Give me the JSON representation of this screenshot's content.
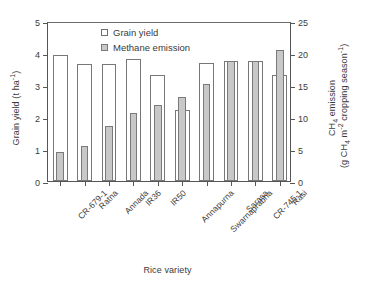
{
  "chart_data": {
    "type": "bar",
    "title": "",
    "xlabel": "Rice variety",
    "ylabel": "Grain yield (t ha-1)",
    "y2label": "CH4 emission (g CH4 m-2 cropping season-1)",
    "categories": [
      "CR-679-1",
      "Ratna",
      "Annada",
      "IR36",
      "IR50",
      "Annapurna",
      "Swarnaprabha",
      "Sarasa",
      "CR-745-1",
      "Rasi"
    ],
    "series": [
      {
        "name": "Grain yield",
        "axis": "left",
        "unit": "t ha-1",
        "values": [
          3.95,
          3.66,
          3.67,
          3.82,
          3.32,
          2.21,
          3.68,
          3.76,
          3.76,
          3.31
        ]
      },
      {
        "name": "Methane emission",
        "axis": "right",
        "unit": "g CH4 m-2 cropping season-1",
        "values": [
          4.5,
          5.5,
          8.6,
          10.7,
          11.9,
          13.1,
          15.2,
          18.8,
          18.8,
          20.4
        ]
      }
    ],
    "ylim": [
      0,
      5
    ],
    "y2lim": [
      0,
      25
    ],
    "yticks": [
      0,
      1,
      2,
      3,
      4,
      5
    ],
    "y2ticks": [
      0,
      5,
      10,
      15,
      20,
      25
    ],
    "grid": false,
    "legend_position": "top-center",
    "frame": true
  },
  "axes": {
    "left_title_main": "Grain yield (t ha",
    "left_title_sup": "-1",
    "left_title_tail": ")",
    "right_title_line1_main": "CH",
    "right_title_line1_sub": "4",
    "right_title_line1_tail": " emission",
    "right_title_line2_a": "(g CH",
    "right_title_line2_sub1": "4",
    "right_title_line2_b": " m",
    "right_title_line2_sup1": "-2",
    "right_title_line2_c": " cropping season",
    "right_title_line2_sup2": "-1",
    "right_title_line2_d": ")",
    "x_title": "Rice variety"
  },
  "legend": {
    "items": [
      {
        "label": "Grain yield",
        "color": "#ffffff",
        "border": "#6f6f6f"
      },
      {
        "label": "Methane emission",
        "color": "#c8c8c8",
        "border": "#7a7a7a"
      }
    ]
  },
  "colors": {
    "grain_yield_fill": "#ffffff",
    "methane_fill": "#c8c8c8",
    "axis": "#555555",
    "text": "#3a3a3a"
  }
}
